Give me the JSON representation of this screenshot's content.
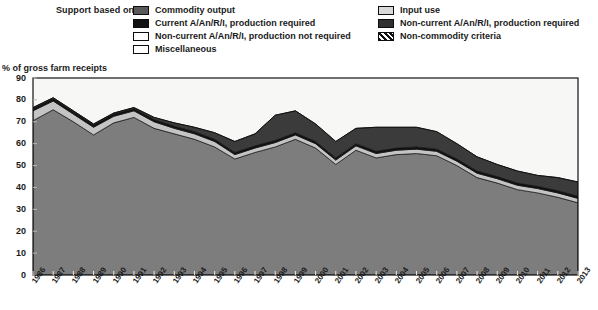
{
  "legend": {
    "title": "Support based on:",
    "left_items": [
      {
        "label": "Commodity output",
        "swatch": "commodity-output-swatch",
        "color": "#595959"
      },
      {
        "label": "Current A/An/R/I, production required",
        "swatch": "current-production-required-swatch",
        "color": "#111111"
      },
      {
        "label": "Non-current A/An/R/I, production not required",
        "swatch": "noncurrent-production-not-required-swatch",
        "color": "#ffffff"
      },
      {
        "label": "Miscellaneous",
        "swatch": "miscellaneous-swatch",
        "color": "#ffffff"
      }
    ],
    "right_items": [
      {
        "label": "Input use",
        "swatch": "input-use-swatch",
        "color": "#d9d9d9"
      },
      {
        "label": "Non-current A/An/R/I, production required",
        "swatch": "noncurrent-production-required-swatch",
        "color": "#303030"
      },
      {
        "label": "Non-commodity criteria",
        "swatch": "non-commodity-criteria-swatch",
        "color": "#111111"
      }
    ]
  },
  "chart_data": {
    "type": "area",
    "title": "",
    "subtitle": "",
    "xlabel": "",
    "ylabel": "% of gross farm receipts",
    "ylim": [
      0,
      90
    ],
    "yticks": [
      0,
      10,
      20,
      30,
      40,
      50,
      60,
      70,
      80,
      90
    ],
    "grid": false,
    "legend_position": "top",
    "stacked": true,
    "categories": [
      "1986",
      "1987",
      "1988",
      "1989",
      "1990",
      "1991",
      "1992",
      "1993",
      "1994",
      "1995",
      "1996",
      "1997",
      "1998",
      "1999",
      "2000",
      "2001",
      "2002",
      "2003",
      "2004",
      "2005",
      "2006",
      "2007",
      "2008",
      "2009",
      "2010",
      "2011",
      "2012",
      "2013"
    ],
    "series": [
      {
        "name": "Commodity output",
        "color": "#7d7d7d",
        "values": [
          70.5,
          75.5,
          70.0,
          64.0,
          69.5,
          72.0,
          67.0,
          64.5,
          62.0,
          58.5,
          53.0,
          56.0,
          58.5,
          62.0,
          58.0,
          50.5,
          57.0,
          53.5,
          55.0,
          55.5,
          54.5,
          50.0,
          44.5,
          42.0,
          39.0,
          37.5,
          35.5,
          33.0
        ]
      },
      {
        "name": "Input use",
        "color": "#c4c4c4",
        "values": [
          4.5,
          4.0,
          3.5,
          3.5,
          3.0,
          3.0,
          3.0,
          2.5,
          2.5,
          2.5,
          2.0,
          2.0,
          2.0,
          2.0,
          2.0,
          2.0,
          2.0,
          2.0,
          2.0,
          2.0,
          2.0,
          2.0,
          2.0,
          2.0,
          2.0,
          2.0,
          2.0,
          2.0
        ]
      },
      {
        "name": "Current A/An/R/I, production required",
        "color": "#111111",
        "values": [
          1.0,
          1.0,
          1.0,
          1.0,
          1.0,
          1.0,
          1.0,
          1.0,
          1.0,
          1.0,
          1.0,
          1.0,
          1.0,
          1.0,
          1.0,
          1.0,
          1.0,
          1.0,
          1.0,
          1.0,
          1.0,
          1.0,
          1.0,
          1.0,
          1.0,
          1.0,
          1.0,
          1.0
        ]
      },
      {
        "name": "Non-current A/An/R/I, production required",
        "color": "#3b3b3b",
        "values": [
          0.5,
          0.5,
          0.5,
          0.5,
          0.5,
          0.5,
          1.0,
          1.5,
          2.0,
          3.0,
          5.0,
          5.5,
          11.5,
          10.0,
          8.0,
          7.5,
          7.0,
          11.0,
          9.5,
          9.0,
          8.0,
          7.0,
          6.5,
          5.5,
          5.5,
          5.0,
          6.0,
          6.5
        ]
      },
      {
        "name": "Non-current A/An/R/I, production not required",
        "color": "#f2f2f2",
        "values": [
          0.0,
          0.0,
          0.0,
          0.0,
          0.0,
          0.0,
          0.0,
          0.0,
          0.0,
          0.0,
          0.0,
          0.0,
          0.0,
          0.0,
          0.0,
          0.0,
          0.0,
          0.0,
          0.0,
          0.0,
          0.0,
          0.0,
          0.0,
          0.0,
          0.0,
          0.0,
          0.0,
          0.0
        ]
      },
      {
        "name": "Non-commodity criteria",
        "color": "#ffffff",
        "values": [
          0.0,
          0.0,
          0.0,
          0.0,
          0.0,
          0.0,
          0.0,
          0.0,
          0.0,
          0.0,
          0.0,
          0.0,
          0.0,
          0.0,
          0.0,
          0.0,
          0.0,
          0.0,
          0.0,
          0.0,
          0.0,
          0.0,
          0.0,
          0.0,
          0.0,
          0.0,
          0.0,
          0.0
        ]
      },
      {
        "name": "Miscellaneous",
        "color": "#ffffff",
        "values": [
          0.0,
          0.0,
          0.0,
          0.0,
          0.0,
          0.0,
          0.0,
          0.0,
          0.0,
          0.0,
          0.0,
          0.0,
          0.0,
          0.0,
          0.0,
          0.0,
          0.0,
          0.0,
          0.0,
          0.0,
          0.0,
          0.0,
          0.0,
          0.0,
          0.0,
          0.0,
          0.0,
          0.0
        ]
      }
    ],
    "totals": [
      76.5,
      81.0,
      75.0,
      69.0,
      74.0,
      76.5,
      72.0,
      69.5,
      67.5,
      65.0,
      61.0,
      64.5,
      73.0,
      75.0,
      69.0,
      61.0,
      67.0,
      67.5,
      67.5,
      67.5,
      65.5,
      60.0,
      54.0,
      50.5,
      47.5,
      45.5,
      44.5,
      42.5
    ]
  }
}
